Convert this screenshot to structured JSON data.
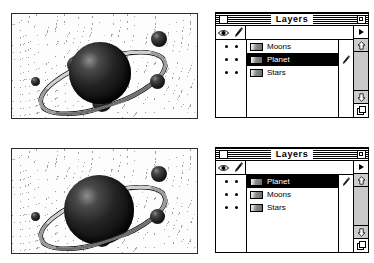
{
  "figures": [
    {
      "name": "top-figure",
      "artwork": {
        "name": "planet-illustration-moons-behind",
        "description": "Ringed planet with moons on a starfield; moons layer above planet layer",
        "objects": [
          "planet",
          "ring",
          "moon-upper-right",
          "moon-left-small",
          "moon-right",
          "moon-upper-left",
          "moon-bottom"
        ]
      },
      "palette": {
        "title": "Layers",
        "close_box": "close-box",
        "zoom_box": "zoom-box",
        "columns": {
          "visibility_icon": "eye-icon",
          "edit_icon": "pencil-icon"
        },
        "rows": [
          {
            "name": "Moons",
            "visible": true,
            "editable": true,
            "selected": false,
            "active_pencil": false
          },
          {
            "name": "Planet",
            "visible": true,
            "editable": true,
            "selected": true,
            "active_pencil": true
          },
          {
            "name": "Stars",
            "visible": true,
            "editable": true,
            "selected": false,
            "active_pencil": false
          }
        ],
        "rail": {
          "menu_triangle": "palette-menu-triangle-icon",
          "scroll_up": "scroll-up-arrow-icon",
          "scroll_down": "scroll-down-arrow-icon",
          "new_layer": "new-layer-icon"
        }
      }
    },
    {
      "name": "bottom-figure",
      "artwork": {
        "name": "planet-illustration-planet-in-front",
        "description": "Ringed planet with moons on a starfield; planet layer above moons layer",
        "objects": [
          "planet",
          "ring",
          "moon-upper-right",
          "moon-left-small",
          "moon-right",
          "moon-upper-left",
          "moon-bottom"
        ]
      },
      "palette": {
        "title": "Layers",
        "close_box": "close-box",
        "zoom_box": "zoom-box",
        "columns": {
          "visibility_icon": "eye-icon",
          "edit_icon": "pencil-icon"
        },
        "rows": [
          {
            "name": "Planet",
            "visible": true,
            "editable": true,
            "selected": true,
            "active_pencil": true
          },
          {
            "name": "Moons",
            "visible": true,
            "editable": true,
            "selected": false,
            "active_pencil": false
          },
          {
            "name": "Stars",
            "visible": true,
            "editable": true,
            "selected": false,
            "active_pencil": false
          }
        ],
        "rail": {
          "menu_triangle": "palette-menu-triangle-icon",
          "scroll_up": "scroll-up-arrow-icon",
          "scroll_down": "scroll-down-arrow-icon",
          "new_layer": "new-layer-icon"
        }
      }
    }
  ],
  "colors": {
    "window_border": "#000000",
    "selection": "#000000",
    "selection_text": "#ffffff",
    "rail_button": "#cccccc",
    "scroll_track": "#c9c9c9",
    "canvas": "#fdfdfd"
  }
}
